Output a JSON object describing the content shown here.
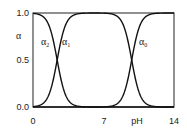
{
  "chart_data": {
    "type": "line",
    "title": "",
    "xlabel": "pH",
    "ylabel": "α",
    "xlim": [
      0,
      14
    ],
    "ylim": [
      0,
      1
    ],
    "x_ticks": [
      "0",
      "7",
      "14"
    ],
    "y_ticks": [
      "0.0",
      "0.5",
      "1.0"
    ],
    "grid": false,
    "legend": "inline labels",
    "pKa": [
      2.4,
      9.8
    ],
    "series": [
      {
        "name": "α2",
        "label_position": [
          1.0,
          0.75
        ],
        "description": "fully protonated fraction, falls from 1 to 0 around pH 2.4"
      },
      {
        "name": "α1",
        "label_position": [
          3.3,
          0.75
        ],
        "description": "intermediate fraction, rises around pH 2.4, falls around pH 9.8"
      },
      {
        "name": "α0",
        "label_position": [
          10.5,
          0.75
        ],
        "description": "fully deprotonated fraction, rises from 0 to 1 around pH 9.8"
      }
    ]
  },
  "labels": {
    "alpha": "α",
    "ph": "pH",
    "a2": "α",
    "a2_sub": "2",
    "a1": "α",
    "a1_sub": "1",
    "a0": "α",
    "a0_sub": "0",
    "y0": "0.0",
    "y05": "0.5",
    "y1": "1.0",
    "x0": "0",
    "x7": "7",
    "x14": "14"
  }
}
